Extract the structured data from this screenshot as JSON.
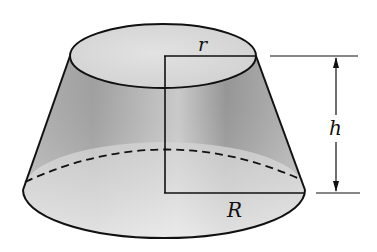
{
  "diagram": {
    "labels": {
      "top_radius": "r",
      "height": "h",
      "bottom_radius": "R"
    },
    "colors": {
      "stroke": "#111111",
      "fill_light": "#e6e6e6",
      "fill_dark": "#9a9a9a",
      "background": "#ffffff"
    }
  }
}
